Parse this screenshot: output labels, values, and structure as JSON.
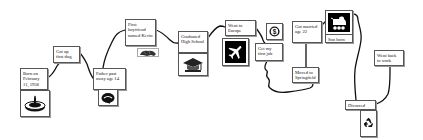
{
  "diagram": {
    "type": "life timeline",
    "events": [
      {
        "id": "born",
        "label": "Born on February 11, 1958",
        "icon": "birthday-cake-icon"
      },
      {
        "id": "dog",
        "label": "Got up first dog"
      },
      {
        "id": "father",
        "label": "Father past away age 14",
        "icon": "tombstone-icon"
      },
      {
        "id": "boyfriend",
        "label": "First boyfriend named Kevin",
        "icon": "animal-icon"
      },
      {
        "id": "graduated",
        "label": "Graduated High School",
        "icon": "graduation-cap-icon"
      },
      {
        "id": "europe",
        "label": "Went to Europe",
        "icon": "airplane-icon"
      },
      {
        "id": "money",
        "label": "",
        "icon": "dollar-icon"
      },
      {
        "id": "job",
        "label": "Get my first job"
      },
      {
        "id": "married",
        "label": "Got married age 22"
      },
      {
        "id": "moved",
        "label": "Moved to Springfield"
      },
      {
        "id": "son",
        "label": "Son born",
        "icon": "baby-carriage-icon"
      },
      {
        "id": "divorced",
        "label": "Divorced",
        "icon": "recycle-icon"
      },
      {
        "id": "work",
        "label": "Went back to work"
      }
    ],
    "colors": {
      "line": "#111111",
      "box_border": "#555555",
      "background": "#ffffff"
    }
  }
}
